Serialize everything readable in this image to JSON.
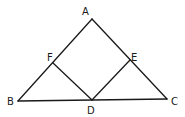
{
  "diagram": {
    "type": "geometry",
    "points": {
      "A": {
        "label": "A",
        "x": 92,
        "y": 19,
        "label_x": 82,
        "label_y": 15
      },
      "B": {
        "label": "B",
        "x": 18,
        "y": 101,
        "label_x": 7,
        "label_y": 105
      },
      "C": {
        "label": "C",
        "x": 167,
        "y": 99,
        "label_x": 171,
        "label_y": 105
      },
      "D": {
        "label": "D",
        "x": 92,
        "y": 100,
        "label_x": 87,
        "label_y": 114
      },
      "E": {
        "label": "E",
        "x": 130,
        "y": 60,
        "label_x": 131,
        "label_y": 61
      },
      "F": {
        "label": "F",
        "x": 53,
        "y": 63,
        "label_x": 47,
        "label_y": 61
      }
    },
    "segments": [
      {
        "name": "segment-ab",
        "from": "A",
        "to": "B"
      },
      {
        "name": "segment-ac",
        "from": "A",
        "to": "C"
      },
      {
        "name": "segment-bc",
        "from": "B",
        "to": "C"
      },
      {
        "name": "segment-fd",
        "from": "F",
        "to": "D"
      },
      {
        "name": "segment-de",
        "from": "D",
        "to": "E"
      }
    ],
    "line_color": "#1a1a1a",
    "background_color": "#ffffff"
  }
}
